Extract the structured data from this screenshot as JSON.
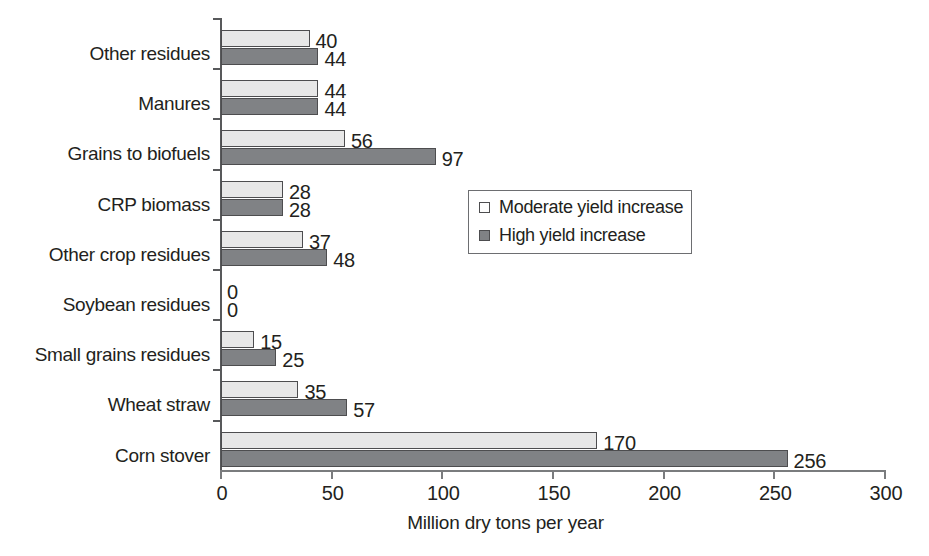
{
  "chart_data": {
    "type": "bar",
    "orientation": "horizontal",
    "title": "",
    "xlabel": "Million dry tons per year",
    "ylabel": "",
    "xlim": [
      0,
      300
    ],
    "xticks": [
      0,
      50,
      100,
      150,
      200,
      250,
      300
    ],
    "grid": false,
    "legend_position": "center-right",
    "categories": [
      "Other residues",
      "Manures",
      "Grains to biofuels",
      "CRP biomass",
      "Other crop residues",
      "Soybean residues",
      "Small grains residues",
      "Wheat straw",
      "Corn stover"
    ],
    "series": [
      {
        "name": "Moderate yield increase",
        "color": "#e7e7e7",
        "values": [
          40,
          44,
          56,
          28,
          37,
          0,
          15,
          35,
          170
        ]
      },
      {
        "name": "High yield increase",
        "color": "#808285",
        "values": [
          44,
          44,
          97,
          28,
          48,
          0,
          25,
          57,
          256
        ]
      }
    ],
    "value_labels": [
      [
        "40",
        "44"
      ],
      [
        "44",
        "44"
      ],
      [
        "56",
        "97"
      ],
      [
        "28",
        "28"
      ],
      [
        "37",
        "48"
      ],
      [
        "0",
        "0"
      ],
      [
        "15",
        "25"
      ],
      [
        "35",
        "57"
      ],
      [
        "170",
        "256"
      ]
    ]
  },
  "legend": {
    "items": [
      {
        "label": "Moderate yield increase",
        "swatch": "moderate"
      },
      {
        "label": "High yield increase",
        "swatch": "high"
      }
    ]
  },
  "axis": {
    "x_title": "Million dry tons per year",
    "x_tick_labels": [
      "0",
      "50",
      "100",
      "150",
      "200",
      "250",
      "300"
    ]
  },
  "colors": {
    "moderate_fill": "#e7e7e7",
    "high_fill": "#808285",
    "bar_border": "#4d4d4f",
    "axis": "#58595b",
    "text": "#231f20",
    "background": "#ffffff"
  }
}
